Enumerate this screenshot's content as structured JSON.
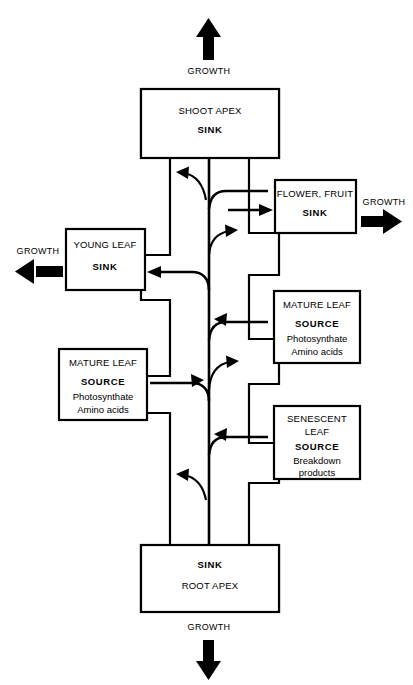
{
  "diagram": {
    "stroke_color": "#000000",
    "background_color": "#ffffff",
    "organs": {
      "shoot_apex": {
        "name": "SHOOT APEX",
        "role": "SINK",
        "detail_line1": "",
        "detail_line2": ""
      },
      "flower_fruit": {
        "name": "FLOWER, FRUIT",
        "role": "SINK",
        "detail_line1": "",
        "detail_line2": ""
      },
      "young_leaf": {
        "name": "YOUNG LEAF",
        "role": "SINK",
        "detail_line1": "",
        "detail_line2": ""
      },
      "mature_leaf_right": {
        "name": "MATURE LEAF",
        "role": "SOURCE",
        "detail_line1": "Photosynthate",
        "detail_line2": "Amino acids"
      },
      "mature_leaf_left": {
        "name": "MATURE LEAF",
        "role": "SOURCE",
        "detail_line1": "Photosynthate",
        "detail_line2": "Amino acids"
      },
      "senescent_leaf": {
        "name_line1": "SENESCENT",
        "name_line2": "LEAF",
        "role": "SOURCE",
        "detail_line1": "Breakdown",
        "detail_line2": "products"
      },
      "root_apex": {
        "name": "ROOT APEX",
        "role": "SINK",
        "detail_line1": "",
        "detail_line2": ""
      }
    },
    "growth_labels": {
      "top": "GROWTH",
      "right": "GROWTH",
      "left": "GROWTH",
      "bottom": "GROWTH"
    }
  }
}
